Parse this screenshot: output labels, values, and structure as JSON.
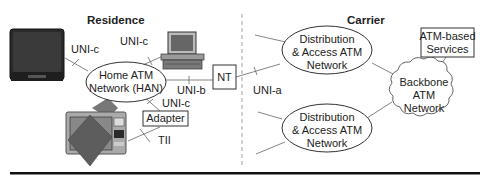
{
  "diagram": {
    "regions": {
      "residence": "Residence",
      "carrier": "Carrier"
    },
    "nodes": {
      "han": [
        "Home ATM",
        "Network (HAN)"
      ],
      "nt": "NT",
      "adapter": "Adapter",
      "dist_top": [
        "Distribution",
        "& Access ATM",
        "Network"
      ],
      "dist_bottom": [
        "Distribution",
        "& Access ATM",
        "Network"
      ],
      "backbone": [
        "Backbone",
        "ATM",
        "Network"
      ],
      "services": [
        "ATM-based",
        "Services"
      ]
    },
    "devices": {
      "tv": "television-icon",
      "pc": "computer-icon",
      "settop": "set-top-device-icon"
    },
    "interfaces": {
      "tv_han": "UNI-c",
      "pc_han": "UNI-c",
      "han_nt": "UNI-b",
      "han_adapter": "UNI-c",
      "adapter_device": "TII",
      "nt_carrier": "UNI-a"
    },
    "colors": {
      "line": "#666666",
      "outline": "#333333",
      "divider": "#999999",
      "rule": "#111111"
    }
  }
}
